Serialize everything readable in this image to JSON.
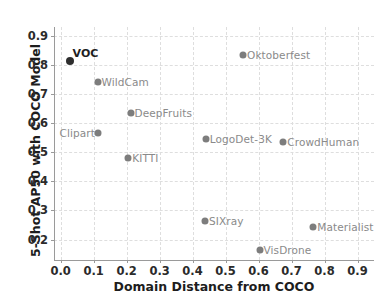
{
  "chart_data": {
    "type": "scatter",
    "title": "",
    "xlabel": "Domain Distance from COCO",
    "ylabel": "5-Shot AP50 with COCO Model",
    "xlim": [
      -0.02,
      0.95
    ],
    "ylim": [
      0.13,
      0.93
    ],
    "xticks": [
      "0.0",
      "0.1",
      "0.2",
      "0.3",
      "0.4",
      "0.5",
      "0.6",
      "0.7",
      "0.8",
      "0.9"
    ],
    "xtick_values": [
      0.0,
      0.1,
      0.2,
      0.3,
      0.4,
      0.5,
      0.6,
      0.7,
      0.8,
      0.9
    ],
    "yticks": [
      "0.2",
      "0.3",
      "0.4",
      "0.5",
      "0.6",
      "0.7",
      "0.8",
      "0.9"
    ],
    "ytick_values": [
      0.2,
      0.3,
      0.4,
      0.5,
      0.6,
      0.7,
      0.8,
      0.9
    ],
    "grid": true,
    "legend": false,
    "point_color": "#7d7d7d",
    "highlight_color": "#2e2e2e",
    "points": [
      {
        "label": "VOC",
        "x": 0.027,
        "y": 0.812,
        "labelpos": "above",
        "highlight": true
      },
      {
        "label": "WildCam",
        "x": 0.112,
        "y": 0.74,
        "labelpos": "right",
        "highlight": false
      },
      {
        "label": "DeepFruits",
        "x": 0.212,
        "y": 0.636,
        "labelpos": "right",
        "highlight": false
      },
      {
        "label": "Clipart",
        "x": 0.113,
        "y": 0.566,
        "labelpos": "leftof",
        "highlight": false
      },
      {
        "label": "KITTI",
        "x": 0.205,
        "y": 0.481,
        "labelpos": "right",
        "highlight": false
      },
      {
        "label": "Oktoberfest",
        "x": 0.553,
        "y": 0.834,
        "labelpos": "right",
        "highlight": false
      },
      {
        "label": "LogoDet-3K",
        "x": 0.44,
        "y": 0.545,
        "labelpos": "right",
        "highlight": false
      },
      {
        "label": "CrowdHuman",
        "x": 0.675,
        "y": 0.536,
        "labelpos": "right",
        "highlight": false
      },
      {
        "label": "SIXray",
        "x": 0.438,
        "y": 0.264,
        "labelpos": "right",
        "highlight": false
      },
      {
        "label": "Materialist",
        "x": 0.766,
        "y": 0.244,
        "labelpos": "right",
        "highlight": false
      },
      {
        "label": "VisDrone",
        "x": 0.603,
        "y": 0.164,
        "labelpos": "right",
        "highlight": false
      }
    ]
  }
}
